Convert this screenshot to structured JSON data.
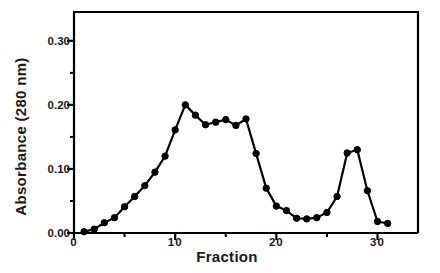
{
  "chart_data": {
    "type": "line",
    "title": "",
    "xlabel": "Fraction",
    "ylabel": "Absorbance (280 nm)",
    "xlim": [
      0,
      34
    ],
    "ylim": [
      0.0,
      0.345
    ],
    "grid": false,
    "legend": null,
    "marker": "filled-circle",
    "line_color": "#000000",
    "marker_color": "#000000",
    "axis_color": "#000000",
    "background": "#ffffff",
    "xticks": [
      0,
      10,
      20,
      30
    ],
    "xtick_labels": [
      "0",
      "10",
      "20",
      "30"
    ],
    "xminor_ticks": [
      5,
      15,
      25
    ],
    "yticks": [
      0.0,
      0.1,
      0.2,
      0.3
    ],
    "ytick_labels": [
      "0.00",
      "0.10",
      "0.20",
      "0.30"
    ],
    "yminor_ticks": [
      0.05,
      0.15,
      0.25
    ],
    "x": [
      1,
      2,
      3,
      4,
      5,
      6,
      7,
      8,
      9,
      10,
      11,
      12,
      13,
      14,
      15,
      16,
      17,
      18,
      19,
      20,
      21,
      22,
      23,
      24,
      25,
      26,
      27,
      28,
      29,
      30,
      31
    ],
    "values": [
      0.002,
      0.006,
      0.016,
      0.024,
      0.041,
      0.057,
      0.074,
      0.095,
      0.12,
      0.161,
      0.2,
      0.184,
      0.169,
      0.173,
      0.177,
      0.168,
      0.178,
      0.124,
      0.07,
      0.042,
      0.035,
      0.023,
      0.022,
      0.024,
      0.032,
      0.057,
      0.125,
      0.13,
      0.066,
      0.018,
      0.015
    ],
    "series": [
      {
        "name": "Absorbance",
        "values": [
          0.002,
          0.006,
          0.016,
          0.024,
          0.041,
          0.057,
          0.074,
          0.095,
          0.12,
          0.161,
          0.2,
          0.184,
          0.169,
          0.173,
          0.177,
          0.168,
          0.178,
          0.124,
          0.07,
          0.042,
          0.035,
          0.023,
          0.022,
          0.024,
          0.032,
          0.057,
          0.125,
          0.13,
          0.066,
          0.018,
          0.015
        ]
      }
    ],
    "annotations": []
  }
}
